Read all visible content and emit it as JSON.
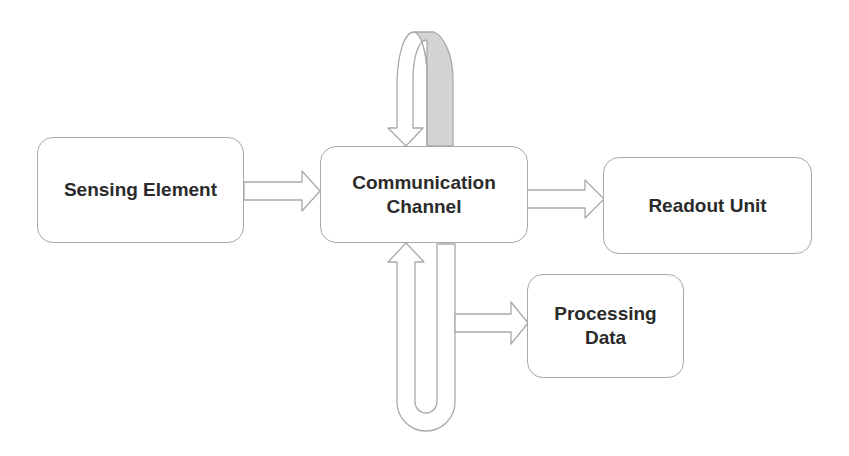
{
  "diagram": {
    "type": "block-diagram",
    "nodes": [
      {
        "id": "sensing",
        "label": "Sensing Element"
      },
      {
        "id": "comm",
        "label": "Communication\nChannel"
      },
      {
        "id": "readout",
        "label": "Readout Unit"
      },
      {
        "id": "processing",
        "label": "Processing\nData"
      }
    ],
    "edges": [
      {
        "from": "sensing",
        "to": "comm",
        "style": "block-arrow"
      },
      {
        "from": "comm",
        "to": "readout",
        "style": "block-arrow"
      },
      {
        "from": "comm",
        "to": "processing",
        "style": "block-arrow"
      },
      {
        "from": "comm",
        "to": "comm",
        "style": "loop-top"
      },
      {
        "from": "comm",
        "to": "comm",
        "style": "loop-bottom"
      }
    ],
    "colors": {
      "outline": "#a9a9a9",
      "text": "#2b2b2b",
      "loop_shade": "#d4d4d4"
    }
  }
}
